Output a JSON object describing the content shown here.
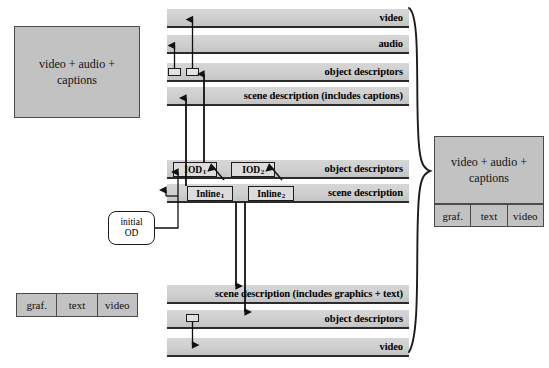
{
  "diagram": {
    "colors": {
      "band_fill": "#cfcfcf",
      "band_line": "#2b2b2b",
      "grey_box": "#c2c2c2",
      "token_fill": "#dcdcdc",
      "stroke": "#1c1c1c",
      "page_background": "#ffffff"
    }
  },
  "left_panel": {
    "video_audio_captions_box": {
      "line1": "video + audio +",
      "line2": "captions"
    },
    "media_strip": {
      "cells": [
        "graf.",
        "text",
        "video"
      ]
    }
  },
  "right_panel": {
    "video_audio_captions_box": {
      "line1": "video + audio +",
      "line2": "captions"
    },
    "media_strip": {
      "cells": [
        "graf.",
        "text",
        "video"
      ]
    }
  },
  "callout": {
    "line1": "initial",
    "line2": "OD"
  },
  "streams": {
    "top_group": [
      {
        "label": "video"
      },
      {
        "label": "audio"
      },
      {
        "label": "object descriptors"
      },
      {
        "label": "scene description (includes captions)"
      }
    ],
    "middle_group": [
      {
        "label": "object descriptors"
      },
      {
        "label": "scene description"
      }
    ],
    "bottom_group": [
      {
        "label": "scene description (includes graphics + text)"
      },
      {
        "label": "object descriptors"
      },
      {
        "label": "video"
      }
    ]
  },
  "tokens": {
    "iod1": {
      "base": "IOD",
      "sub": "1"
    },
    "iod2": {
      "base": "IOD",
      "sub": "2"
    },
    "inline1": {
      "base": "Inline",
      "sub": "1"
    },
    "inline2": {
      "base": "Inline",
      "sub": "2"
    }
  }
}
